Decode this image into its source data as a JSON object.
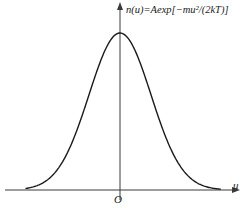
{
  "chart_data": {
    "type": "line",
    "title": "",
    "formula_annotation": "n(u)=Aexp[−mu²/(2kT)]",
    "xlabel": "u",
    "ylabel": "",
    "origin_label": "O",
    "grid": false,
    "legend": null,
    "series": [
      {
        "name": "n(u)",
        "x": [
          -3,
          -2.5,
          -2,
          -1.5,
          -1,
          -0.5,
          0,
          0.5,
          1,
          1.5,
          2,
          2.5,
          3
        ],
        "y": [
          0.011,
          0.044,
          0.135,
          0.325,
          0.607,
          0.882,
          1.0,
          0.882,
          0.607,
          0.325,
          0.135,
          0.044,
          0.011
        ]
      }
    ],
    "axis_ranges": {
      "x": [
        -3.2,
        3.5
      ],
      "y": [
        0,
        1.18
      ]
    }
  },
  "colors": {
    "axis": "#3a3a3a",
    "curve": "#1a1a1a",
    "background": "#ffffff"
  }
}
